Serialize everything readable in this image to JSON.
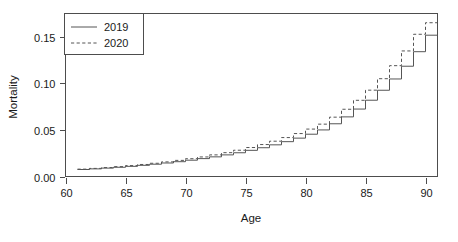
{
  "chart_data": {
    "type": "line",
    "title": "",
    "xlabel": "Age",
    "ylabel": "Mortality",
    "xlim": [
      60,
      91
    ],
    "ylim": [
      0.0,
      0.175
    ],
    "grid": false,
    "step": true,
    "step_mode": "hv",
    "legend_position": "top-left",
    "xticks": [
      60,
      65,
      70,
      75,
      80,
      85,
      90
    ],
    "xtick_labels": [
      "60",
      "65",
      "70",
      "75",
      "80",
      "85",
      "90"
    ],
    "yticks": [
      0.0,
      0.05,
      0.1,
      0.15
    ],
    "ytick_labels": [
      "0.00",
      "0.05",
      "0.10",
      "0.15"
    ],
    "x": [
      61,
      62,
      63,
      64,
      65,
      66,
      67,
      68,
      69,
      70,
      71,
      72,
      73,
      74,
      75,
      76,
      77,
      78,
      79,
      80,
      81,
      82,
      83,
      84,
      85,
      86,
      87,
      88,
      89,
      90
    ],
    "series": [
      {
        "name": "2019",
        "style": "solid",
        "color": "#555555",
        "values": [
          0.0075,
          0.0082,
          0.009,
          0.0099,
          0.0109,
          0.012,
          0.0132,
          0.0145,
          0.0159,
          0.0175,
          0.0192,
          0.0211,
          0.0232,
          0.0255,
          0.0281,
          0.0309,
          0.034,
          0.0374,
          0.0412,
          0.0454,
          0.05,
          0.0566,
          0.064,
          0.0724,
          0.0819,
          0.0926,
          0.1047,
          0.1184,
          0.134,
          0.1517
        ]
      },
      {
        "name": "2020",
        "style": "dashed",
        "color": "#555555",
        "values": [
          0.0079,
          0.0087,
          0.0096,
          0.0106,
          0.0117,
          0.0129,
          0.0142,
          0.0157,
          0.0173,
          0.0191,
          0.021,
          0.0232,
          0.0256,
          0.0282,
          0.0311,
          0.0343,
          0.0379,
          0.0418,
          0.0461,
          0.0509,
          0.0562,
          0.0637,
          0.0722,
          0.0818,
          0.0927,
          0.105,
          0.119,
          0.1348,
          0.1527,
          0.1651
        ]
      }
    ]
  },
  "legend": {
    "entries": [
      {
        "label": "2019",
        "style": "solid"
      },
      {
        "label": "2020",
        "style": "dashed"
      }
    ]
  },
  "axes": {
    "x_title": "Age",
    "y_title": "Mortality"
  }
}
